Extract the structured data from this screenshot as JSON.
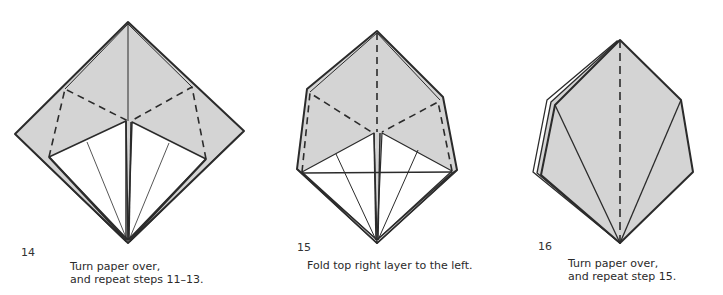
{
  "colors": {
    "paper_gray": "#d4d4d4",
    "line": "#2b2b2b",
    "background": "#ffffff"
  },
  "steps": [
    {
      "number": "14",
      "caption_line1": "Turn paper over,",
      "caption_line2": "and repeat steps 11–13."
    },
    {
      "number": "15",
      "caption_line1": "Fold top right layer to the left.",
      "caption_line2": ""
    },
    {
      "number": "16",
      "caption_line1": "Turn paper over,",
      "caption_line2": "and repeat step 15."
    }
  ]
}
